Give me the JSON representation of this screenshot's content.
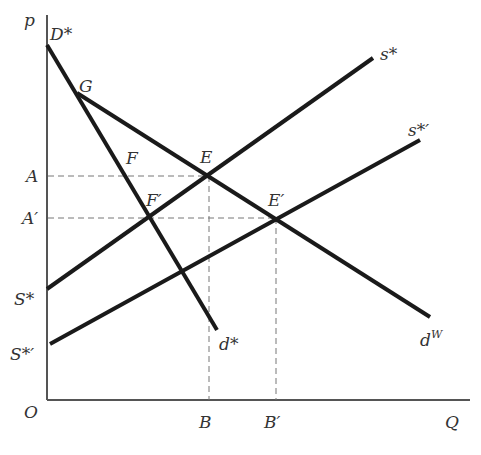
{
  "diagram": {
    "title": "",
    "axes": {
      "y_label": "p",
      "x_label": "Q",
      "origin_label": "O",
      "color": "#555555"
    },
    "price_levels": [
      {
        "label": "A",
        "y": 176
      },
      {
        "label": "A′",
        "y": 218
      }
    ],
    "quantity_levels": [
      {
        "label": "B",
        "x": 209
      },
      {
        "label": "B′",
        "x": 276
      }
    ],
    "curves": {
      "domestic_demand": {
        "start_label": "D*",
        "end_label": "d*"
      },
      "world_demand": {
        "kink_label": "G",
        "end_label": "d",
        "end_sup": "W"
      },
      "supply": {
        "start_label": "S*",
        "end_label": "s*"
      },
      "supply_shifted": {
        "start_label": "S*′",
        "end_label": "s*′"
      }
    },
    "points": {
      "G": "G",
      "F": "F",
      "F_prime": "F′",
      "E": "E",
      "E_prime": "E′"
    },
    "line_color": "#1a1a1a",
    "dash_color": "#777777"
  }
}
